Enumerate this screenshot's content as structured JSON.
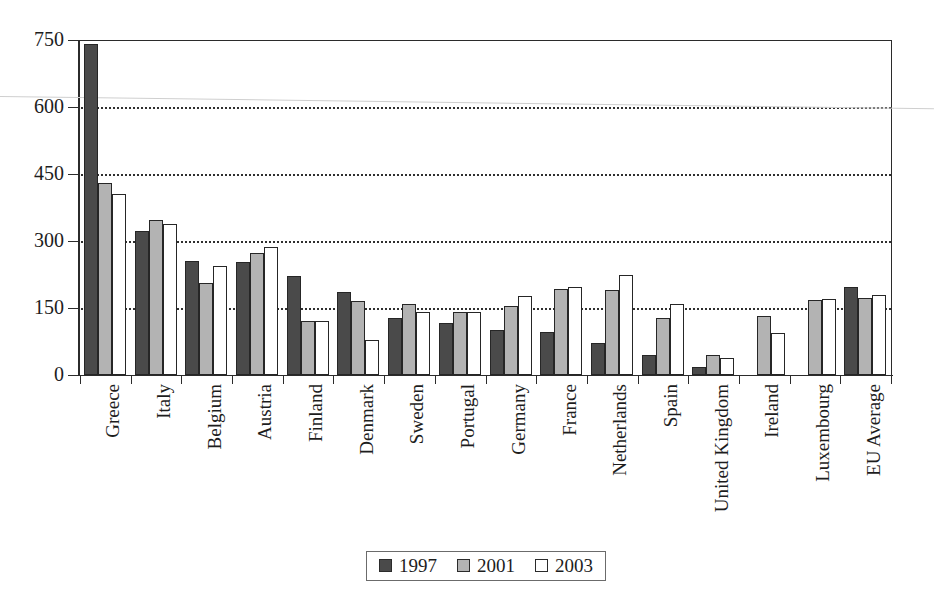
{
  "chart_data": {
    "type": "bar",
    "title": "",
    "xlabel": "",
    "ylabel": "",
    "ylim": [
      0,
      750
    ],
    "yticks": [
      0,
      150,
      300,
      450,
      600,
      750
    ],
    "grid": true,
    "legend_position": "bottom-center",
    "categories": [
      "Greece",
      "Italy",
      "Belgium",
      "Austria",
      "Finland",
      "Denmark",
      "Sweden",
      "Portugal",
      "Germany",
      "France",
      "Netherlands",
      "Spain",
      "United Kingdom",
      "Ireland",
      "Luxembourg",
      "EU Average"
    ],
    "series": [
      {
        "name": "1997",
        "color": "#4a4a4a",
        "values": [
          740,
          322,
          255,
          252,
          222,
          185,
          128,
          117,
          100,
          97,
          72,
          45,
          18,
          null,
          null,
          196
        ]
      },
      {
        "name": "2001",
        "color": "#b3b3b3",
        "values": [
          430,
          348,
          205,
          273,
          122,
          165,
          158,
          140,
          155,
          192,
          190,
          128,
          45,
          133,
          167,
          172
        ]
      },
      {
        "name": "2003",
        "color": "#ffffff",
        "values": [
          405,
          338,
          245,
          287,
          122,
          78,
          140,
          140,
          178,
          198,
          225,
          158,
          38,
          95,
          170,
          180
        ]
      }
    ]
  },
  "legend": {
    "entries": [
      {
        "label": "1997",
        "key": "y1997"
      },
      {
        "label": "2001",
        "key": "y2001"
      },
      {
        "label": "2003",
        "key": "y2003"
      }
    ]
  }
}
